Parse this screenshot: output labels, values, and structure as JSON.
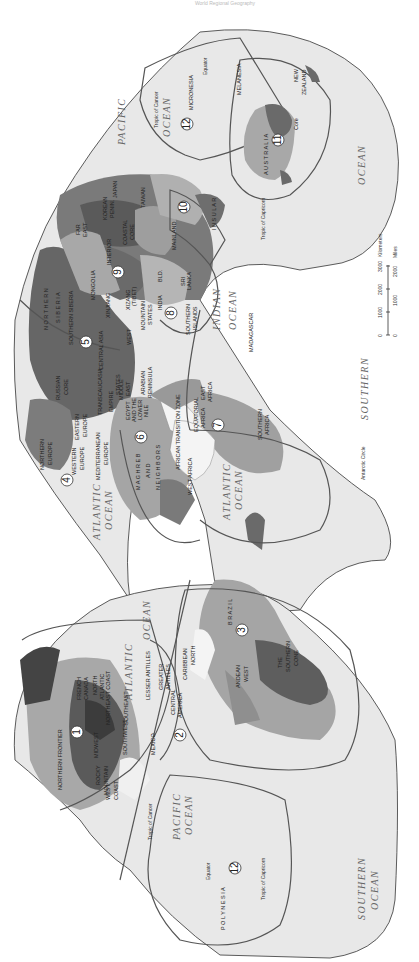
{
  "caption": "World Regional Geography",
  "map": {
    "title": "World Realms and Regions",
    "orientation": "rotated 90° clockwise",
    "realms": [
      {
        "number": "1",
        "name": "North America",
        "regions": [
          "Northern Frontier",
          "French Canada",
          "North Atlantic",
          "Northeast Coast",
          "Midwest",
          "Southeast",
          "Southwest",
          "Rocky Mountain",
          "West Coast"
        ]
      },
      {
        "number": "2",
        "name": "Middle America",
        "regions": [
          "Mexico",
          "Central America",
          "Greater Antilles",
          "Lesser Antilles"
        ]
      },
      {
        "number": "3",
        "name": "South America",
        "regions": [
          "Caribbean North",
          "Brazil",
          "Andean West",
          "The Southern Cone"
        ]
      },
      {
        "number": "4",
        "name": "Europe",
        "regions": [
          "Northern Europe",
          "Western Europe",
          "Eastern Europe",
          "Mediterranean Europe"
        ]
      },
      {
        "number": "5",
        "name": "Russia",
        "regions": [
          "Russian Core",
          "Southern Siberia",
          "Northern Siberia",
          "Far East",
          "Transcaucasia"
        ]
      },
      {
        "number": "6",
        "name": "North Africa / Southwest Asia",
        "regions": [
          "Maghreb and Neighbors",
          "Egypt and the Lower Nile",
          "Middle East",
          "Arabian Peninsula",
          "Empire States",
          "Central Asia",
          "Turkestan",
          "African Transition Zone"
        ]
      },
      {
        "number": "7",
        "name": "Subsaharan Africa",
        "regions": [
          "West Africa",
          "Equatorial Africa",
          "East Africa",
          "Southern Africa",
          "Madagascar"
        ]
      },
      {
        "number": "8",
        "name": "South Asia",
        "regions": [
          "India",
          "Mountain States",
          "West",
          "Bangladesh",
          "Sri Lanka",
          "Southern Islands"
        ]
      },
      {
        "number": "9",
        "name": "East Asia",
        "regions": [
          "Mongolia",
          "Xinjiang",
          "Xizang (Tibet)",
          "Interior",
          "Coastal Core",
          "Korean Peninsula",
          "Japan",
          "Taiwan"
        ]
      },
      {
        "number": "10",
        "name": "Southeast Asia",
        "regions": [
          "Mainland",
          "Insular"
        ]
      },
      {
        "number": "11",
        "name": "Austral Realm",
        "regions": [
          "Australia",
          "Core",
          "New Zealand"
        ]
      },
      {
        "number": "12",
        "name": "Pacific Realm",
        "regions": [
          "Micronesia",
          "Melanesia",
          "Polynesia"
        ]
      }
    ],
    "oceans": [
      "Pacific Ocean",
      "Atlantic Ocean",
      "Indian Ocean",
      "Southern Ocean"
    ],
    "lines": [
      "Equator",
      "Tropic of Cancer",
      "Tropic of Capricorn",
      "Antarctic Circle"
    ],
    "scale": {
      "km_label": "Kilometers",
      "km_ticks": [
        "0",
        "1000",
        "2000",
        "3000"
      ],
      "mi_label": "Miles",
      "mi_ticks": [
        "0",
        "1000",
        "2000"
      ]
    },
    "labels": {
      "pacific": "PACIFIC",
      "ocean": "OCEAN",
      "atlantic": "ATLANTIC",
      "indian": "INDIAN",
      "southern": "SOUTHERN",
      "equator": "Equator",
      "cancer": "Tropic of Cancer",
      "capricorn": "Tropic of Capricorn",
      "antarctic": "Antarctic Circle",
      "micronesia": "MICRONESIA",
      "melanesia": "MELANESIA",
      "polynesia": "P O L Y N E S I A",
      "australia": "A U S T R A L I A",
      "nz1": "NEW",
      "nz2": "ZEALAND",
      "core": "Core",
      "insular": "I N S U L A R",
      "mainland": "MAINLAND",
      "taiwan": "TAIWAN",
      "japan": "JAPAN",
      "korean1": "KOREAN",
      "korean2": "PENIN.",
      "coastal1": "COASTAL",
      "coastal2": "CORE",
      "interior": "INTERIOR",
      "fareast1": "FAR",
      "fareast2": "EAST",
      "nsiberia1": "N O R T H E R N",
      "nsiberia2": "S I B E R I A",
      "ssiberia": "SOUTHERN SIBERIA",
      "mongolia": "MONGOLIA",
      "xinjiang": "XINJIANG",
      "xizang1": "XIZANG",
      "xizang2": "(TIBET)",
      "mountain1": "MOUNTAIN",
      "mountain2": "STATES",
      "india": "INDIA",
      "bld": "BLD.",
      "srilanka1": "SRI",
      "srilanka2": "LANKA",
      "southernislands1": "SOUTHERN",
      "southernislands2": "ISLANDS",
      "west": "WEST",
      "centralasia": "CENTRAL ASIA",
      "russian1": "RUSSIAN",
      "russian2": "CORE",
      "transcaucasia": "TRANSCAUCASIA",
      "empire": "EMPIRE",
      "middleeast1": "MIDDLE",
      "middleeast2": "EAST",
      "states": "STATES",
      "arabian1": "ARABIAN",
      "arabian2": "PENINSULA",
      "egypt1": "EGYPT",
      "egypt2": "AND THE",
      "egypt3": "LOWER",
      "egypt4": "NILE",
      "madagascar": "MADAGASCAR",
      "eastafrica1": "EAST",
      "eastafrica2": "AFRICA",
      "equatorial1": "EQUATORIAL",
      "equatorial2": "AFRICA",
      "southernafrica1": "SOUTHERN",
      "southernafrica2": "AFRICA",
      "transition": "AFRICAN TRANSITION ZONE",
      "westafrica": "WEST AFRICA",
      "maghreb1": "M A G H R E B",
      "maghreb2": "A N D",
      "maghreb3": "N E I G H B O R S",
      "neurope1": "NORTHERN",
      "neurope2": "EUROPE",
      "weurope1": "WESTERN",
      "weurope2": "EUROPE",
      "eeurope1": "EASTERN",
      "eeurope2": "EUROPE",
      "meurope1": "MEDITERRANEAN",
      "meurope2": "EUROPE",
      "brazil": "B R A Z I L",
      "southerncone1": "THE",
      "southerncone2": "SOUTHERN",
      "southerncone3": "CONE",
      "andean1": "ANDEAN",
      "andean2": "WEST",
      "caribbean1": "CARIBBEAN",
      "caribbean2": "NORTH",
      "lesser": "LESSER ANTILLES",
      "greater1": "GREATER",
      "greater2": "ANTILLES",
      "central1": "CENTRAL",
      "central2": "AMERICA",
      "mexico": "MEXICO",
      "southeast": "SOUTHEAST",
      "southwest": "SOUTHWEST",
      "northeast1": "NORTH",
      "northeast2": "ATLANTIC",
      "northeast3": "NORTHEAST COAST",
      "french1": "FRENCH",
      "french2": "CANADA",
      "midwest": "MIDWEST",
      "rocky1": "ROCKY",
      "rocky2": "MOUNTAIN",
      "westcoast1": "WEST",
      "westcoast2": "COAST",
      "northernfrontier": "NORTHERN FRONTIER"
    },
    "colors": {
      "ocean": "#e6e6e6",
      "land_light": "#b3b3b3",
      "land_mid": "#8f8f8f",
      "land_dark": "#5c5c5c",
      "boundary": "#555555",
      "white_land": "#f4f4f4"
    }
  }
}
